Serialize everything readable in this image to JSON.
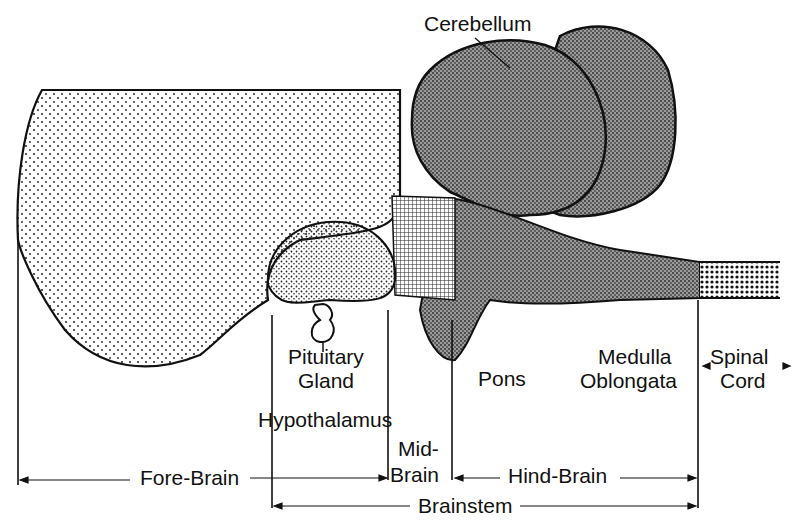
{
  "diagram": {
    "structures": {
      "cerebellum": "Cerebellum",
      "pituitary_line1": "Pituitary",
      "pituitary_line2": "Gland",
      "hypothalamus": "Hypothalamus",
      "pons": "Pons",
      "medulla_line1": "Medulla",
      "medulla_line2": "Oblongata",
      "spinal_line1": "Spinal",
      "spinal_line2": "Cord"
    },
    "regions": {
      "forebrain": "Fore-Brain",
      "midbrain_line1": "Mid-",
      "midbrain_line2": "Brain",
      "hindbrain": "Hind-Brain",
      "brainstem": "Brainstem"
    }
  }
}
